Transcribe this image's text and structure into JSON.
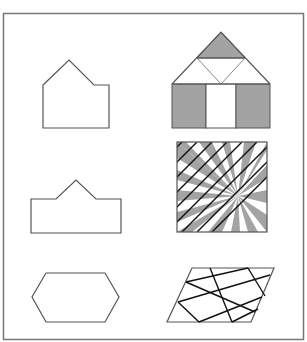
{
  "figure": {
    "frame": {
      "x": 3.5,
      "y": 13.5,
      "width": 300,
      "height": 326,
      "stroke": "#777777"
    },
    "colors": {
      "outline": "#555555",
      "fill_gray": "#a3a3a3",
      "line_black": "#111111",
      "white": "#ffffff"
    },
    "shapes": {
      "pentagon_house": {
        "points": "43,85 69,60 94,85 109,85 109,128 43,128"
      },
      "tiled_house": {
        "roof_top_triangle": "221,32 197,58 245,58",
        "roof_outline": "172,84 221,32 270,84",
        "roof_inner_v": "197,58 221,84 245,58",
        "body_left_gray": {
          "x": 172,
          "y": 84,
          "w": 34,
          "h": 44
        },
        "body_middle_white": {
          "x": 206,
          "y": 84,
          "w": 30,
          "h": 44
        },
        "body_right_gray": {
          "x": 236,
          "y": 84,
          "w": 34,
          "h": 44
        }
      },
      "crown_shape": {
        "points": "31,199 56,199 76,180 96,199 121,199 121,233 31,233"
      },
      "radial_square": {
        "x": 177,
        "y": 142,
        "size": 90,
        "center": [
          238,
          196
        ],
        "wedge_edge_points": [
          [
            177,
            142
          ],
          [
            186,
            142
          ],
          [
            199,
            142
          ],
          [
            212,
            142
          ],
          [
            222,
            142
          ],
          [
            230,
            142
          ],
          [
            244,
            142
          ],
          [
            256,
            142
          ],
          [
            267,
            142
          ],
          [
            267,
            150
          ],
          [
            267,
            165
          ],
          [
            267,
            178
          ],
          [
            267,
            190
          ],
          [
            267,
            203
          ],
          [
            267,
            215
          ],
          [
            267,
            232
          ],
          [
            258,
            232
          ],
          [
            248,
            232
          ],
          [
            240,
            232
          ],
          [
            231,
            232
          ],
          [
            222,
            232
          ],
          [
            208,
            232
          ],
          [
            192,
            232
          ],
          [
            177,
            232
          ],
          [
            177,
            222
          ],
          [
            177,
            212
          ],
          [
            177,
            201
          ],
          [
            177,
            190
          ],
          [
            177,
            180
          ],
          [
            177,
            170
          ],
          [
            177,
            158
          ]
        ],
        "diagonal_line_offsets": [
          -70,
          -55,
          -40,
          -25,
          -10,
          5,
          20,
          35,
          50,
          65,
          80,
          95,
          110,
          125
        ]
      },
      "hexagon": {
        "points": "46,273 105,273 119,297 105,322 46,322 32,297"
      },
      "lattice_parallelogram": {
        "points": "192,268 274,268 251,322 167,322",
        "lines": [
          [
            210,
            268,
            232,
            322
          ],
          [
            248,
            268,
            265,
            296
          ],
          [
            186,
            282,
            255,
            312
          ],
          [
            178,
            302,
            199,
            322
          ],
          [
            186,
            282,
            248,
            268
          ],
          [
            178,
            302,
            270,
            275
          ],
          [
            199,
            322,
            262,
            297
          ],
          [
            232,
            322,
            258,
            309
          ]
        ]
      }
    }
  }
}
